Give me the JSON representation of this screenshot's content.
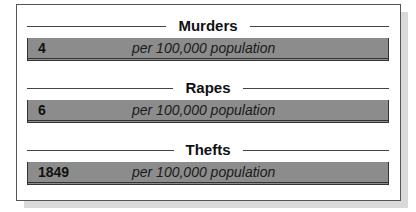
{
  "stats": [
    {
      "label": "Murders",
      "value": "4",
      "unit": "per 100,000 population"
    },
    {
      "label": "Rapes",
      "value": "6",
      "unit": "per 100,000 population"
    },
    {
      "label": "Thefts",
      "value": "1849",
      "unit": "per 100,000 population"
    }
  ],
  "colors": {
    "bar": "#8c8c8c",
    "border": "#333333",
    "shadow": "#d9d9d9"
  }
}
